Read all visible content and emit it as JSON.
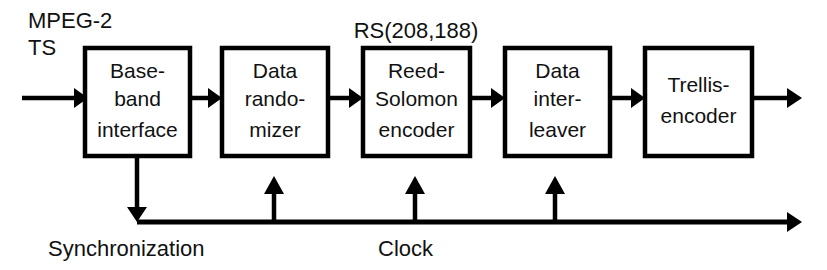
{
  "diagram": {
    "colors": {
      "stroke": "#000000",
      "fill": "#ffffff",
      "text": "#111111"
    },
    "input_label": {
      "line1": "MPEG-2",
      "line2": "TS"
    },
    "annotations": {
      "rs_code": "RS(208,188)",
      "sync": "Synchronization",
      "clock": "Clock"
    },
    "blocks": [
      {
        "id": "baseband-interface",
        "lines": [
          "Base-",
          "band",
          "interface"
        ],
        "x": 85,
        "y": 48,
        "w": 105,
        "h": 108
      },
      {
        "id": "data-randomizer",
        "lines": [
          "Data",
          "rando-",
          "mizer"
        ],
        "x": 222,
        "y": 48,
        "w": 106,
        "h": 108
      },
      {
        "id": "reed-solomon-encoder",
        "lines": [
          "Reed-",
          "Solomon",
          "encoder"
        ],
        "x": 363,
        "y": 48,
        "w": 107,
        "h": 108
      },
      {
        "id": "data-interleaver",
        "lines": [
          "Data",
          "inter-",
          "leaver"
        ],
        "x": 505,
        "y": 48,
        "w": 105,
        "h": 108
      },
      {
        "id": "trellis-encoder",
        "lines": [
          "Trellis-",
          "encoder"
        ],
        "x": 645,
        "y": 48,
        "w": 107,
        "h": 108
      }
    ]
  }
}
